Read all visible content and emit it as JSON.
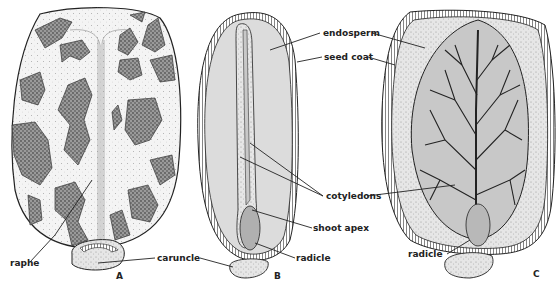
{
  "figure": {
    "panels": [
      {
        "id": "A",
        "label": "A",
        "description": "external view of seed",
        "callouts": [
          "raphe",
          "caruncle"
        ]
      },
      {
        "id": "B",
        "label": "B",
        "description": "longitudinal section, edge view",
        "callouts": [
          "endosperm",
          "seed coat",
          "cotyledons",
          "shoot apex",
          "radicle"
        ]
      },
      {
        "id": "C",
        "label": "C",
        "description": "longitudinal section, face view",
        "callouts": [
          "radicle"
        ]
      }
    ],
    "labels": {
      "raphe": "raphe",
      "caruncle": "caruncle",
      "endosperm": "endosperm",
      "seed_coat": "seed coat",
      "cotyledons": "cotyledons",
      "shoot_apex": "shoot apex",
      "radicle_b": "radicle",
      "radicle_c": "radicle"
    },
    "colors": {
      "ink": "#222222",
      "endosperm_fill": "#dcdcdc",
      "embryo_fill": "#c8c8c8",
      "radicle_fill": "#b0b0b0",
      "seed_surface": "#f2f2f2",
      "mottle": "#7a7a7a"
    }
  }
}
